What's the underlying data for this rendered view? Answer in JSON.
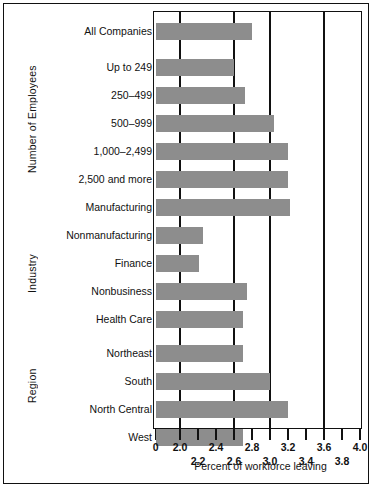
{
  "chart_data": {
    "type": "bar",
    "orientation": "horizontal",
    "title": "",
    "xlabel": "Percent of workforce leaving",
    "ylabel": "",
    "xlim": [
      0,
      4.0
    ],
    "grid": true,
    "legend": null,
    "axis_note": "Broken x-axis: 0 then compressed jump to 2.0, linear 2.0-4.0",
    "major_ticks": [
      "0",
      "2.0",
      "2.4",
      "2.8",
      "3.2",
      "3.6",
      "4.0"
    ],
    "minor_ticks": [
      "2.2",
      "2.6",
      "3.0",
      "3.4",
      "3.8"
    ],
    "gridline_values": [
      2.0,
      2.6,
      3.0,
      3.6,
      4.0
    ],
    "groups": [
      {
        "name": "Number of Employees",
        "categories": [
          "All Companies",
          "Up to 249",
          "250–499",
          "500–999",
          "1,000–2,499",
          "2,500 and more"
        ],
        "values": [
          2.8,
          2.6,
          2.72,
          3.05,
          3.2,
          3.2
        ]
      },
      {
        "name": "Industry",
        "categories": [
          "Manufacturing",
          "Nonmanufacturing",
          "Finance",
          "Nonbusiness",
          "Health Care"
        ],
        "values": [
          3.22,
          2.26,
          2.21,
          2.75,
          2.7
        ]
      },
      {
        "name": "Region",
        "categories": [
          "Northeast",
          "South",
          "North Central",
          "West"
        ],
        "values": [
          2.7,
          3.0,
          3.2,
          2.7
        ]
      }
    ],
    "categories": [
      "All Companies",
      "Up to 249",
      "250–499",
      "500–999",
      "1,000–2,499",
      "2,500 and more",
      "Manufacturing",
      "Nonmanufacturing",
      "Finance",
      "Nonbusiness",
      "Health Care",
      "Northeast",
      "South",
      "North Central",
      "West"
    ],
    "values": [
      2.8,
      2.6,
      2.72,
      3.05,
      3.2,
      3.2,
      3.22,
      2.26,
      2.21,
      2.75,
      2.7,
      2.7,
      3.0,
      3.2,
      2.7
    ],
    "bar_color": "#8d8d8d",
    "axis_color": "#111111"
  }
}
